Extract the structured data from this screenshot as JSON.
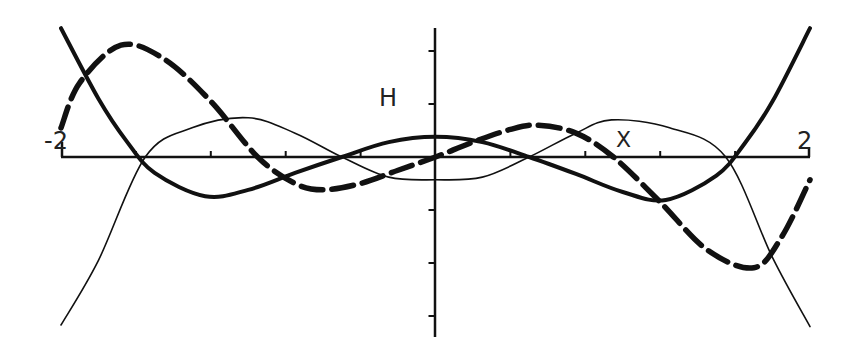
{
  "chart_data": {
    "type": "line",
    "title": "",
    "xlabel": "X",
    "ylabel": "H",
    "xlim": [
      -2,
      2
    ],
    "ylim": [
      -3.4,
      2.4
    ],
    "x_tick_labels": [
      "-2",
      "2"
    ],
    "x_tick_step": 0.4,
    "y_tick_step": 1,
    "grid": false,
    "legend": null,
    "axis_labels": {
      "x_left": "-2",
      "x_right": "2",
      "x_name": "X",
      "y_name": "H"
    },
    "series": [
      {
        "name": "thick-solid-curve",
        "style": "solid-thick",
        "x": [
          -2.0,
          -1.8,
          -1.65,
          -1.5,
          -1.23,
          -1.0,
          -0.75,
          -0.5,
          -0.25,
          0.0,
          0.25,
          0.5,
          0.75,
          1.0,
          1.23,
          1.5,
          1.65,
          1.8,
          2.0
        ],
        "y": [
          2.43,
          1.1,
          0.3,
          -0.3,
          -0.74,
          -0.62,
          -0.3,
          0.0,
          0.28,
          0.38,
          0.28,
          0.0,
          -0.32,
          -0.66,
          -0.81,
          -0.35,
          0.25,
          1.05,
          2.43
        ]
      },
      {
        "name": "thin-solid-curve",
        "style": "solid-thin",
        "x": [
          -2.0,
          -1.8,
          -1.55,
          -1.3,
          -1.0,
          -0.75,
          -0.5,
          -0.25,
          0.0,
          0.25,
          0.5,
          0.75,
          0.94,
          1.25,
          1.55,
          1.8,
          2.0
        ],
        "y": [
          -3.17,
          -1.95,
          0.0,
          0.55,
          0.74,
          0.45,
          0.0,
          -0.38,
          -0.43,
          -0.38,
          0.0,
          0.45,
          0.7,
          0.55,
          0.0,
          -1.9,
          -3.2
        ]
      },
      {
        "name": "thick-dashed-curve",
        "style": "dashed-thick",
        "x": [
          -2.0,
          -1.9,
          -1.68,
          -1.45,
          -1.2,
          -0.95,
          -0.75,
          -0.6,
          -0.4,
          -0.2,
          0.0,
          0.2,
          0.4,
          0.55,
          0.75,
          0.95,
          1.2,
          1.45,
          1.7,
          1.85,
          2.0
        ],
        "y": [
          0.55,
          1.4,
          2.11,
          1.85,
          1.05,
          0.0,
          -0.5,
          -0.62,
          -0.5,
          -0.25,
          0.0,
          0.28,
          0.52,
          0.6,
          0.45,
          0.0,
          -0.85,
          -1.75,
          -2.09,
          -1.5,
          -0.43
        ]
      }
    ]
  },
  "axes": {
    "x_min_label": "-2",
    "x_max_label": "2",
    "x_name": "X",
    "y_name": "H"
  }
}
